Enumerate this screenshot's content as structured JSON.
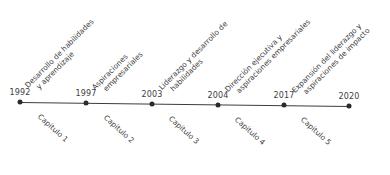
{
  "diagram": {
    "type": "timeline",
    "line_color": "#3c3c3c",
    "events": [
      {
        "year": "1992",
        "description_lines": [
          "Desarrollo de habilidades",
          "y aprendizaje"
        ],
        "chapter": "Capítulo 1"
      },
      {
        "year": "1997",
        "description_lines": [
          "Aspiraciones",
          "empresariales"
        ],
        "chapter": "Capítulo 2"
      },
      {
        "year": "2003",
        "description_lines": [
          "Liderazgo y desarrollo de",
          "habilidades"
        ],
        "chapter": "Capítulo 3"
      },
      {
        "year": "2004",
        "description_lines": [
          "Dirección ejecutiva y",
          "aspiraciones empresariales"
        ],
        "chapter": "Capítulo 4"
      },
      {
        "year": "2017",
        "description_lines": [
          "Expansión del liderazgo y",
          "aspiraciones de impacto"
        ],
        "chapter": "Capítulo 5"
      },
      {
        "year": "2020"
      }
    ]
  }
}
